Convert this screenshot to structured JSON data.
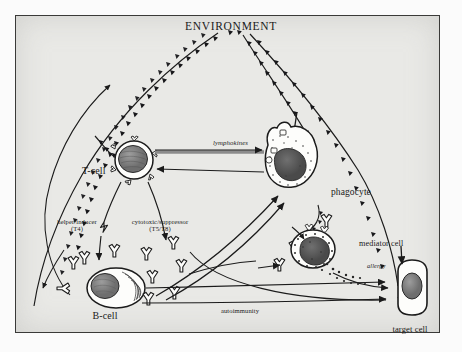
{
  "diagram": {
    "title": "ENVIRONMENT",
    "frame": {
      "border_color": "#3a3a38",
      "background": "#e9e9e6"
    },
    "nodes": [
      {
        "id": "environment",
        "label": "ENVIRONMENT",
        "kind": "title"
      },
      {
        "id": "t-cell",
        "label": "T-cell",
        "kind": "cell"
      },
      {
        "id": "phagocyte",
        "label": "phagocyte",
        "kind": "cell"
      },
      {
        "id": "b-cell",
        "label": "B-cell",
        "kind": "cell"
      },
      {
        "id": "mediator-cell",
        "label": "mediator cell",
        "kind": "cell"
      },
      {
        "id": "target-cell",
        "label": "target cell",
        "kind": "cell"
      }
    ],
    "edge_labels": [
      {
        "id": "lymphokines",
        "label": "lymphokines"
      },
      {
        "id": "helper-inducer",
        "line1": "helper/inducer",
        "line2": "(T4)"
      },
      {
        "id": "cytotoxic-suppressor",
        "line1": "cytotoxic/suppressor",
        "line2": "(T5/T8)"
      },
      {
        "id": "allergy",
        "label": "allergy"
      },
      {
        "id": "autoimmunity",
        "label": "autoimmunity"
      }
    ]
  }
}
